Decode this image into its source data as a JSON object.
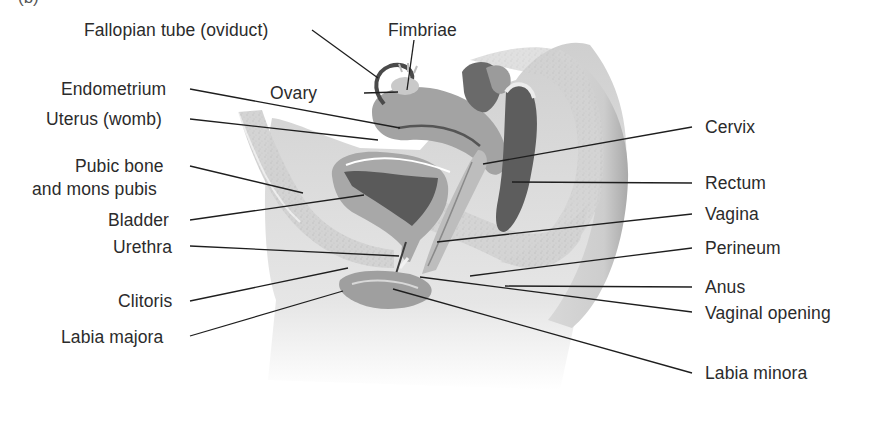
{
  "figure": {
    "panel_label": "(b)",
    "colors": {
      "background": "#ffffff",
      "label_text": "#2b2b2b",
      "leader_line": "#1e1e1e",
      "body_skin": "#d9d9d9",
      "tissue": "#c4c4c4",
      "organ": "#9a9a9a",
      "organ_dark": "#5c5c5c"
    }
  },
  "labels": {
    "left": [
      {
        "id": "fallopian-tube",
        "text": "Fallopian tube (oviduct)",
        "x": 310,
        "y": 17,
        "tx": 378,
        "ty": 78
      },
      {
        "id": "ovary",
        "text": "Ovary",
        "x": 326,
        "y": 84,
        "tx": 398,
        "ty": 92
      },
      {
        "id": "endometrium",
        "text": "Endometrium",
        "x": 180,
        "y": 78,
        "tx": 398,
        "ty": 128
      },
      {
        "id": "uterus",
        "text": "Uterus (womb)",
        "x": 180,
        "y": 108,
        "tx": 376,
        "ty": 139
      },
      {
        "id": "pubic-bone",
        "text": "Pubic bone",
        "x": 180,
        "y": 158,
        "tx": 303,
        "ty": 194
      },
      {
        "id": "mons-pubis",
        "text": "and mons pubis",
        "x": 180,
        "y": 181,
        "tx": null,
        "ty": null
      },
      {
        "id": "bladder",
        "text": "Bladder",
        "x": 180,
        "y": 212,
        "tx": 364,
        "ty": 194
      },
      {
        "id": "urethra",
        "text": "Urethra",
        "x": 180,
        "y": 240,
        "tx": 398,
        "ty": 256
      },
      {
        "id": "clitoris",
        "text": "Clitoris",
        "x": 180,
        "y": 297,
        "tx": 348,
        "ty": 268
      },
      {
        "id": "labia-majora",
        "text": "Labia majora",
        "x": 180,
        "y": 332,
        "tx": 343,
        "ty": 292
      }
    ],
    "top": [
      {
        "id": "fimbriae",
        "text": "Fimbriae",
        "x": 387,
        "y": 17,
        "tx": 407,
        "ty": 90
      }
    ],
    "right": [
      {
        "id": "cervix",
        "text": "Cervix",
        "x": 697,
        "y": 145,
        "tx": 483,
        "ty": 164
      },
      {
        "id": "rectum",
        "text": "Rectum",
        "x": 697,
        "y": 176,
        "tx": 512,
        "ty": 182
      },
      {
        "id": "vagina",
        "text": "Vagina",
        "x": 697,
        "y": 204,
        "tx": 437,
        "ty": 242
      },
      {
        "id": "perineum",
        "text": "Perineum",
        "x": 697,
        "y": 238,
        "tx": 470,
        "ty": 276
      },
      {
        "id": "anus",
        "text": "Anus",
        "x": 697,
        "y": 278,
        "tx": 505,
        "ty": 286
      },
      {
        "id": "vaginal-opening",
        "text": "Vaginal opening",
        "x": 697,
        "y": 303,
        "tx": 420,
        "ty": 277
      },
      {
        "id": "labia-minora",
        "text": "Labia minora",
        "x": 697,
        "y": 365,
        "tx": 393,
        "ty": 288
      }
    ]
  }
}
